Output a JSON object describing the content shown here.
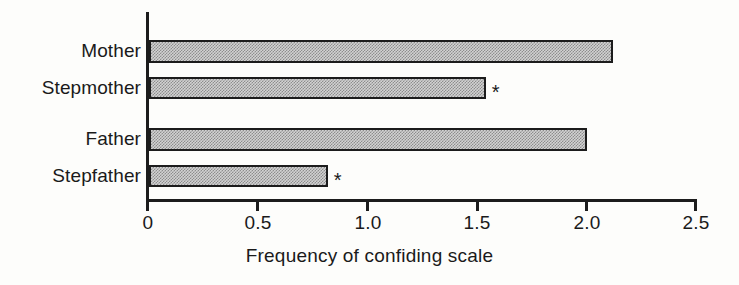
{
  "chart_data": {
    "type": "bar",
    "orientation": "horizontal",
    "title": "",
    "subtitle": "",
    "xlabel": "Frequency of confiding scale",
    "ylabel": "",
    "categories": [
      "Mother",
      "Stepmother",
      "Father",
      "Stepfather"
    ],
    "values": [
      2.1,
      1.52,
      1.98,
      0.8
    ],
    "annotations": [
      "",
      "*",
      "",
      "*"
    ],
    "xlim": [
      0,
      2.5
    ],
    "xticks": [
      0,
      0.5,
      1.0,
      1.5,
      2.0,
      2.5
    ],
    "xtick_labels": [
      "0",
      "0.5",
      "1.0",
      "1.5",
      "2.0",
      "2.5"
    ],
    "grid": false,
    "legend": null,
    "bar_fill": "#d2d2d2",
    "bar_edge": "#1c1c1c",
    "axis_color": "#1c1c1c"
  },
  "axis": {
    "title_x": "Frequency of confiding scale"
  },
  "ticks": [
    {
      "label": "0",
      "value": 0
    },
    {
      "label": "0.5",
      "value": 0.5
    },
    {
      "label": "1.0",
      "value": 1.0
    },
    {
      "label": "1.5",
      "value": 1.5
    },
    {
      "label": "2.0",
      "value": 2.0
    },
    {
      "label": "2.5",
      "value": 2.5
    }
  ],
  "bars": [
    {
      "label": "Mother",
      "value": 2.1,
      "mark": ""
    },
    {
      "label": "Stepmother",
      "value": 1.52,
      "mark": "*"
    },
    {
      "label": "Father",
      "value": 1.98,
      "mark": ""
    },
    {
      "label": "Stepfather",
      "value": 0.8,
      "mark": "*"
    }
  ]
}
